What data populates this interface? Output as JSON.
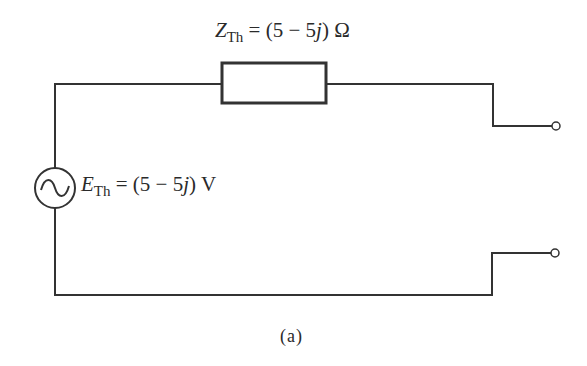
{
  "figure": {
    "caption": "(a)",
    "impedance": {
      "symbol": "Z",
      "subscript": "Th",
      "equals": "= (5 − 5",
      "imag": "j",
      "tail": ") Ω"
    },
    "source": {
      "symbol": "E",
      "subscript": "Th",
      "equals": "= (5 − 5",
      "imag": "j",
      "tail": ") V",
      "icon": "ac-source-icon"
    },
    "terminals": [
      "terminal-top",
      "terminal-bottom"
    ],
    "colors": {
      "line": "#333333",
      "background": "#ffffff"
    }
  }
}
